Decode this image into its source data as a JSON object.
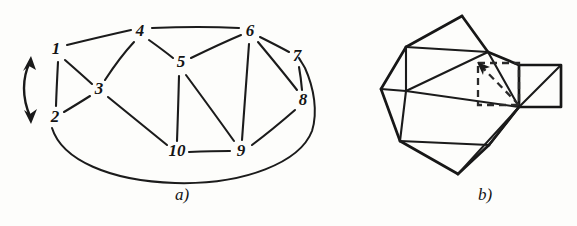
{
  "figure": {
    "background_color": "#fdfdfb",
    "ink_color": "#1b1b1b",
    "panels": [
      {
        "id": "panel-a",
        "caption": "a)",
        "caption_x": 182,
        "caption_y": 200,
        "type": "graph-diagram",
        "description": "Planar graph with ten numbered vertices and a double-headed curved arrow at the left",
        "nodes": [
          {
            "id": "1",
            "label": "1",
            "x": 56,
            "y": 50
          },
          {
            "id": "2",
            "label": "2",
            "x": 55,
            "y": 118
          },
          {
            "id": "3",
            "label": "3",
            "x": 99,
            "y": 90
          },
          {
            "id": "4",
            "label": "4",
            "x": 140,
            "y": 32
          },
          {
            "id": "5",
            "label": "5",
            "x": 181,
            "y": 63
          },
          {
            "id": "6",
            "label": "6",
            "x": 250,
            "y": 32
          },
          {
            "id": "7",
            "label": "7",
            "x": 297,
            "y": 57
          },
          {
            "id": "8",
            "label": "8",
            "x": 303,
            "y": 101
          },
          {
            "id": "9",
            "label": "9",
            "x": 241,
            "y": 152
          },
          {
            "id": "10",
            "label": "10",
            "x": 177,
            "y": 152
          }
        ],
        "edges": [
          {
            "from": "1",
            "to": "2"
          },
          {
            "from": "1",
            "to": "3"
          },
          {
            "from": "1",
            "to": "4"
          },
          {
            "from": "2",
            "to": "3"
          },
          {
            "from": "3",
            "to": "4"
          },
          {
            "from": "3",
            "to": "10"
          },
          {
            "from": "4",
            "to": "5"
          },
          {
            "from": "4",
            "to": "6"
          },
          {
            "from": "5",
            "to": "6"
          },
          {
            "from": "5",
            "to": "9"
          },
          {
            "from": "5",
            "to": "10"
          },
          {
            "from": "6",
            "to": "7"
          },
          {
            "from": "6",
            "to": "8"
          },
          {
            "from": "6",
            "to": "9"
          },
          {
            "from": "7",
            "to": "8"
          },
          {
            "from": "8",
            "to": "9"
          },
          {
            "from": "9",
            "to": "10"
          }
        ],
        "outer_edge": {
          "from": "2",
          "to": "7",
          "style": "long-curve-below"
        },
        "arrow": {
          "name": "double-headed-curved-arrow",
          "x": 28,
          "y_top": 58,
          "y_bottom": 122,
          "direction": "bidirectional-vertical"
        }
      },
      {
        "id": "panel-b",
        "caption": "b)",
        "caption_x": 485,
        "caption_y": 200,
        "type": "polyhedron-projection",
        "description": "Polyhedron net / projection with a solid right-hand square carrying a diagonal and a dashed square with a dashed diagonal arrow pointing up-left",
        "vertices": [
          {
            "id": "v-top",
            "x": 462,
            "y": 16
          },
          {
            "id": "v-upper-left",
            "x": 406,
            "y": 47
          },
          {
            "id": "v-upper-mid",
            "x": 488,
            "y": 52
          },
          {
            "id": "v-left",
            "x": 381,
            "y": 89
          },
          {
            "id": "v-inner-left",
            "x": 406,
            "y": 91
          },
          {
            "id": "v-right-upper",
            "x": 519,
            "y": 65
          },
          {
            "id": "v-right-lower",
            "x": 519,
            "y": 107
          },
          {
            "id": "v-far-right-up",
            "x": 561,
            "y": 65
          },
          {
            "id": "v-far-right-dn",
            "x": 561,
            "y": 107
          },
          {
            "id": "v-lower-left",
            "x": 400,
            "y": 141
          },
          {
            "id": "v-lower-mid",
            "x": 489,
            "y": 145
          },
          {
            "id": "v-bottom",
            "x": 458,
            "y": 174
          }
        ],
        "solid_square": {
          "name": "right-solid-square",
          "x": 519,
          "y": 65,
          "width": 42,
          "height": 42,
          "diagonal": "bottom-left-to-top-right"
        },
        "dashed_square": {
          "name": "dashed-square-overlay",
          "x": 478,
          "y": 63,
          "width": 41,
          "height": 42,
          "diagonal": "bottom-right-to-top-left",
          "arrowhead": "top-left"
        }
      }
    ]
  }
}
